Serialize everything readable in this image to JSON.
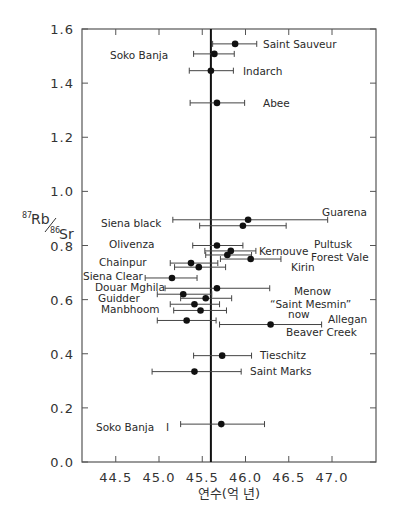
{
  "chart_data": {
    "type": "scatter",
    "title": "",
    "xlabel": "연수(억 년)",
    "ylabel": "87Rb/86Sr",
    "ylabel_parts": {
      "sup1": "87",
      "main1": "Rb",
      "sup2": "86",
      "main2": "Sr"
    },
    "xlim": [
      44.2,
      47.6
    ],
    "ylim": [
      0.0,
      1.6
    ],
    "x_ticks": [
      "44.5",
      "45.0",
      "45.5",
      "46.0",
      "46.5",
      "47.0"
    ],
    "y_ticks": [
      "0.0",
      "0.2",
      "0.4",
      "0.6",
      "0.8",
      "1.0",
      "1.2",
      "1.4",
      "1.6"
    ],
    "reference_line_x": 45.6,
    "grid": false,
    "points": [
      {
        "y": 1.545,
        "x": 45.88,
        "xmin": 45.62,
        "xmax": 46.13
      },
      {
        "y": 1.508,
        "x": 45.64,
        "xmin": 45.4,
        "xmax": 45.87
      },
      {
        "y": 1.446,
        "x": 45.6,
        "xmin": 45.35,
        "xmax": 45.86
      },
      {
        "y": 1.327,
        "x": 45.67,
        "xmin": 45.36,
        "xmax": 45.99
      },
      {
        "y": 0.895,
        "x": 46.03,
        "xmin": 45.16,
        "xmax": 46.95
      },
      {
        "y": 0.873,
        "x": 45.97,
        "xmin": 45.47,
        "xmax": 46.47
      },
      {
        "y": 0.8,
        "x": 45.67,
        "xmin": 45.39,
        "xmax": 45.97
      },
      {
        "y": 0.78,
        "x": 45.83,
        "xmin": 45.53,
        "xmax": 46.12
      },
      {
        "y": 0.765,
        "x": 45.79,
        "xmin": 45.54,
        "xmax": 46.07
      },
      {
        "y": 0.75,
        "x": 46.06,
        "xmin": 45.71,
        "xmax": 46.41
      },
      {
        "y": 0.735,
        "x": 45.37,
        "xmin": 45.13,
        "xmax": 45.68
      },
      {
        "y": 0.72,
        "x": 45.46,
        "xmin": 45.18,
        "xmax": 45.77
      },
      {
        "y": 0.68,
        "x": 45.15,
        "xmin": 44.84,
        "xmax": 45.44
      },
      {
        "y": 0.642,
        "x": 45.67,
        "xmin": 45.07,
        "xmax": 46.28
      },
      {
        "y": 0.62,
        "x": 45.28,
        "xmin": 44.98,
        "xmax": 45.61
      },
      {
        "y": 0.605,
        "x": 45.54,
        "xmin": 45.25,
        "xmax": 45.84
      },
      {
        "y": 0.583,
        "x": 45.41,
        "xmin": 45.13,
        "xmax": 45.7
      },
      {
        "y": 0.56,
        "x": 45.48,
        "xmin": 45.17,
        "xmax": 45.78
      },
      {
        "y": 0.523,
        "x": 45.32,
        "xmin": 44.98,
        "xmax": 45.66
      },
      {
        "y": 0.508,
        "x": 46.29,
        "xmin": 45.7,
        "xmax": 46.88
      },
      {
        "y": 0.393,
        "x": 45.73,
        "xmin": 45.4,
        "xmax": 46.07
      },
      {
        "y": 0.334,
        "x": 45.41,
        "xmin": 44.92,
        "xmax": 45.95
      },
      {
        "y": 0.14,
        "x": 45.72,
        "xmin": 45.25,
        "xmax": 46.22
      }
    ],
    "annotations": [
      {
        "text": "Saint Sauveur",
        "x": 263,
        "y": 48
      },
      {
        "text": "Soko Banja",
        "x": 110,
        "y": 59
      },
      {
        "text": "Indarch",
        "x": 243,
        "y": 75
      },
      {
        "text": "Abee",
        "x": 263,
        "y": 107
      },
      {
        "text": "Guarena",
        "x": 322,
        "y": 216
      },
      {
        "text": "Siena black",
        "x": 101,
        "y": 227
      },
      {
        "text": "Olivenza",
        "x": 109,
        "y": 248
      },
      {
        "text": "Pultusk",
        "x": 314,
        "y": 248
      },
      {
        "text": "Kernouve",
        "x": 259,
        "y": 255
      },
      {
        "text": "Forest Vale",
        "x": 311,
        "y": 261
      },
      {
        "text": "Chainpur",
        "x": 99,
        "y": 266
      },
      {
        "text": "Kirin",
        "x": 291,
        "y": 271
      },
      {
        "text": "Siena Clear",
        "x": 83,
        "y": 280
      },
      {
        "text": "Douar Mghila",
        "x": 95,
        "y": 291
      },
      {
        "text": "Menow",
        "x": 294,
        "y": 295
      },
      {
        "text": "Guidder",
        "x": 98,
        "y": 302
      },
      {
        "text": "“Saint Mesmin”",
        "x": 270,
        "y": 308
      },
      {
        "text": "Manbhoom",
        "x": 101,
        "y": 313
      },
      {
        "text": "now",
        "x": 288,
        "y": 318
      },
      {
        "text": "Allegan",
        "x": 328,
        "y": 323
      },
      {
        "text": "Beaver Creek",
        "x": 286,
        "y": 336
      },
      {
        "text": "Tieschitz",
        "x": 260,
        "y": 359
      },
      {
        "text": "Saint Marks",
        "x": 250,
        "y": 375
      },
      {
        "text": "Soko Banja",
        "x": 96,
        "y": 431
      }
    ],
    "extra_marks": [
      {
        "text": "I",
        "x": 166,
        "y": 431
      }
    ]
  }
}
